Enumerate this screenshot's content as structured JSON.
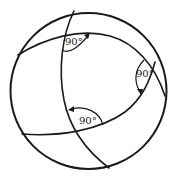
{
  "diagram": {
    "angles": [
      {
        "id": "top-left",
        "label": "90°"
      },
      {
        "id": "right",
        "label": "90°"
      },
      {
        "id": "bottom",
        "label": "90°"
      }
    ],
    "colors": {
      "line": "#1a1a1a",
      "background": "#ffffff"
    }
  }
}
